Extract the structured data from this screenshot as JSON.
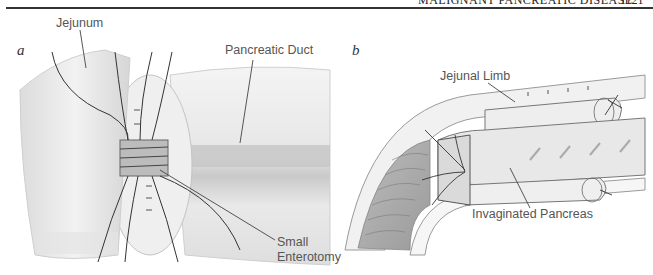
{
  "running_head": {
    "title": "MALIGNANT PANCREATIC DISEASE",
    "page_number": "1121"
  },
  "figure": {
    "panel_a": {
      "letter": "a",
      "labels": {
        "jejunum": "Jejunum",
        "pancreatic_duct": "Pancreatic Duct",
        "small_enterotomy_line1": "Small",
        "small_enterotomy_line2": "Enterotomy"
      }
    },
    "panel_b": {
      "letter": "b",
      "labels": {
        "jejunal_limb": "Jejunal Limb",
        "invaginated_pancreas": "Invaginated Pancreas"
      }
    }
  }
}
